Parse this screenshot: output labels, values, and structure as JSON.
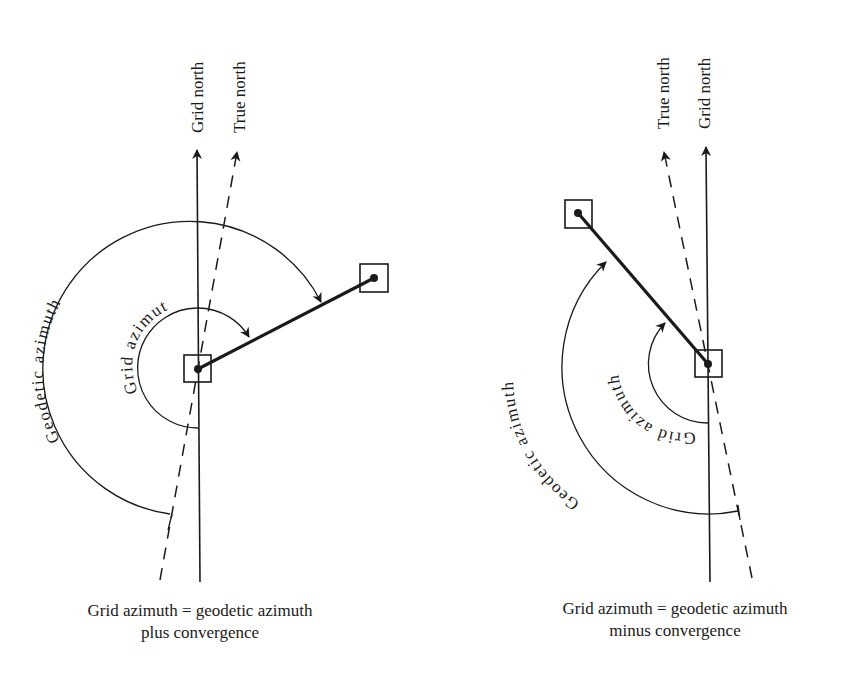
{
  "colors": {
    "ink": "#1a1a1a",
    "background": "#ffffff"
  },
  "left_diagram": {
    "grid_north_label": "Grid north",
    "true_north_label": "True north",
    "geodetic_arc_label": "Geodetic azimuth",
    "grid_arc_label": "Grid azimuth",
    "caption_line1": "Grid azimuth = geodetic azimuth",
    "caption_line2": "plus convergence"
  },
  "right_diagram": {
    "true_north_label": "True north",
    "grid_north_label": "Grid north",
    "geodetic_arc_label": "Geodetic azimuth",
    "grid_arc_label": "Grid azimuth",
    "caption_line1": "Grid azimuth = geodetic azimuth",
    "caption_line2": "minus convergence"
  }
}
